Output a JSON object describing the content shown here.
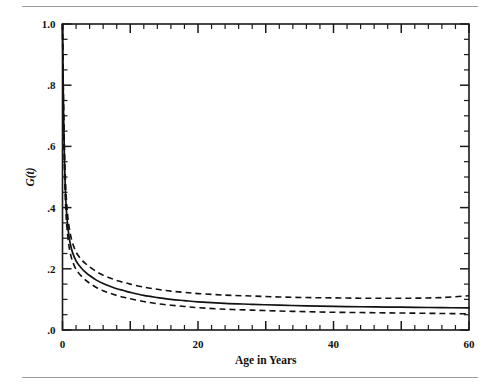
{
  "figure": {
    "top_rule": "",
    "bottom_rule": ""
  },
  "chart_data": {
    "type": "line",
    "title": "",
    "subtitle": "",
    "xlabel": "Age in Years",
    "ylabel": "G(t)",
    "xlim": [
      0,
      60
    ],
    "ylim": [
      0,
      1.0
    ],
    "grid": false,
    "legend_position": "none",
    "x_ticks_major": [
      0,
      10,
      20,
      30,
      40,
      50,
      60
    ],
    "x_tick_labels": [
      "0",
      "",
      "20",
      "",
      "40",
      "",
      "60"
    ],
    "x_tick_minor_step": 2,
    "y_ticks_major": [
      0.0,
      0.2,
      0.4,
      0.6,
      0.8,
      1.0
    ],
    "y_tick_labels": [
      ".0",
      ".2",
      ".4",
      ".6",
      ".8",
      "1.0"
    ],
    "y_tick_minor_step": 0.05,
    "x": [
      0,
      0.15,
      0.3,
      0.5,
      0.75,
      1,
      1.25,
      1.5,
      2,
      2.5,
      3,
      3.5,
      4,
      5,
      6,
      7,
      8,
      9,
      10,
      12,
      14,
      16,
      18,
      20,
      24,
      28,
      32,
      36,
      40,
      44,
      48,
      52,
      56,
      60
    ],
    "series": [
      {
        "name": "G(t) estimate",
        "style": "solid",
        "values": [
          1.0,
          0.72,
          0.55,
          0.42,
          0.345,
          0.3,
          0.272,
          0.252,
          0.226,
          0.21,
          0.197,
          0.187,
          0.178,
          0.163,
          0.152,
          0.143,
          0.135,
          0.129,
          0.123,
          0.113,
          0.106,
          0.1,
          0.096,
          0.092,
          0.087,
          0.084,
          0.081,
          0.079,
          0.077,
          0.076,
          0.075,
          0.074,
          0.073,
          0.072
        ]
      },
      {
        "name": "upper 95% confidence band",
        "style": "dashed",
        "values": [
          1.0,
          0.745,
          0.585,
          0.455,
          0.378,
          0.333,
          0.304,
          0.283,
          0.255,
          0.238,
          0.225,
          0.215,
          0.206,
          0.191,
          0.179,
          0.17,
          0.162,
          0.156,
          0.15,
          0.14,
          0.133,
          0.127,
          0.123,
          0.119,
          0.114,
          0.111,
          0.108,
          0.106,
          0.105,
          0.104,
          0.104,
          0.104,
          0.106,
          0.112
        ]
      },
      {
        "name": "lower 95% confidence band",
        "style": "dashed",
        "values": [
          1.0,
          0.695,
          0.515,
          0.385,
          0.312,
          0.268,
          0.242,
          0.223,
          0.198,
          0.183,
          0.171,
          0.161,
          0.153,
          0.139,
          0.128,
          0.12,
          0.113,
          0.107,
          0.102,
          0.093,
          0.086,
          0.081,
          0.077,
          0.073,
          0.068,
          0.065,
          0.062,
          0.06,
          0.058,
          0.057,
          0.056,
          0.055,
          0.054,
          0.053
        ]
      }
    ],
    "annotations": []
  }
}
